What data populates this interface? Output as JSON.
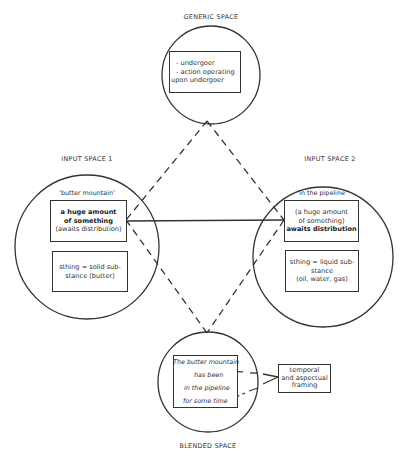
{
  "generic_space": {
    "title": "GENERIC SPACE",
    "lines": [
      "- undergoer",
      "- action operating",
      "upon undergoer"
    ]
  },
  "input_space_1": {
    "title": "INPUT  SPACE 1",
    "expression": "'butter mountain'",
    "box1": {
      "bold1": "a huge amount",
      "bold2": "of something",
      "normal": "(awaits distribution)"
    },
    "box2": {
      "line1": "sthing = solid sub-",
      "line2": "stance (butter)"
    }
  },
  "input_space_2": {
    "title": "INPUT  SPACE 2",
    "expression": "'in the pipeline'",
    "box1": {
      "normal1": "(a huge amount",
      "normal2": "of something)",
      "bold": "awaits distribution"
    },
    "box2": {
      "line1": "sthing = liquid sub-",
      "line2": "stance",
      "line3": "(oil, water, gas)"
    }
  },
  "blended_space": {
    "title": "BLENDED SPACE",
    "lines": [
      "The butter mountain",
      "has been",
      "in the pipeline",
      "for some time"
    ]
  },
  "framing": {
    "lines": [
      "temporal",
      "and aspectual",
      "framing"
    ]
  },
  "colors": {
    "stroke": "#333333",
    "background": "#ffffff"
  }
}
